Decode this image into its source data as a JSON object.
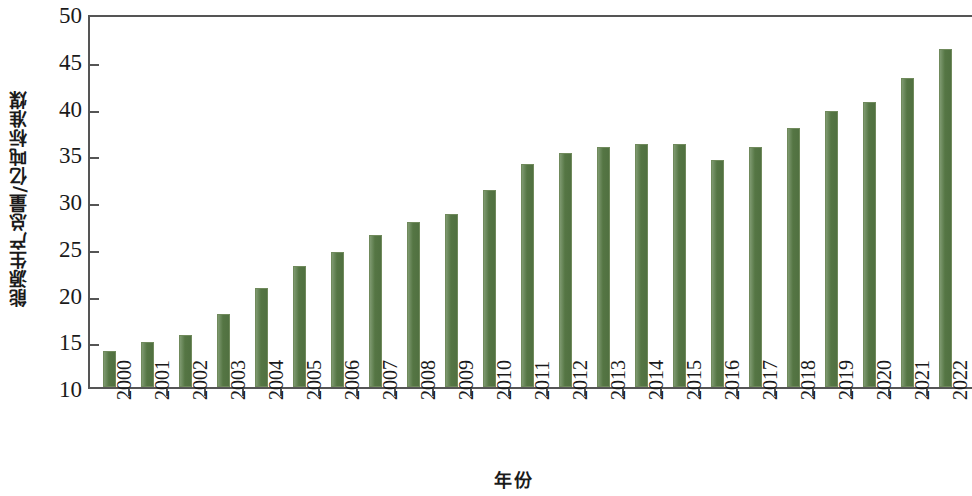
{
  "chart_data": {
    "type": "bar",
    "title": "",
    "xlabel": "年份",
    "ylabel": "能源生产总量/亿吨标准煤",
    "categories": [
      "2000",
      "2001",
      "2002",
      "2003",
      "2004",
      "2005",
      "2006",
      "2007",
      "2008",
      "2009",
      "2010",
      "2011",
      "2012",
      "2013",
      "2014",
      "2015",
      "2016",
      "2017",
      "2018",
      "2019",
      "2020",
      "2021",
      "2022"
    ],
    "values": [
      13.9,
      14.8,
      15.6,
      17.8,
      20.6,
      22.9,
      24.4,
      26.3,
      27.7,
      28.5,
      31.1,
      33.8,
      35.0,
      35.7,
      36.0,
      36.0,
      34.3,
      35.7,
      37.7,
      39.5,
      40.5,
      43.0,
      46.2
    ],
    "series": [
      {
        "name": "能源生产总量",
        "values": [
          13.9,
          14.8,
          15.6,
          17.8,
          20.6,
          22.9,
          24.4,
          26.3,
          27.7,
          28.5,
          31.1,
          33.8,
          35.0,
          35.7,
          36.0,
          36.0,
          34.3,
          35.7,
          37.7,
          39.5,
          40.5,
          43.0,
          46.2
        ],
        "color": "#5a7d48"
      }
    ],
    "ylim": [
      10,
      50
    ],
    "y_ticks": [
      10,
      15,
      20,
      25,
      30,
      35,
      40,
      45,
      50
    ],
    "y_tick_labels": [
      "10",
      "15",
      "20",
      "25",
      "30",
      "35",
      "40",
      "45",
      "50"
    ],
    "grid": false,
    "legend": null,
    "legend_position": "none",
    "bar_color": "#5a7d48",
    "axis_color": "#555555",
    "background_color": "#ffffff",
    "x_tick_label_rotation": 90
  }
}
